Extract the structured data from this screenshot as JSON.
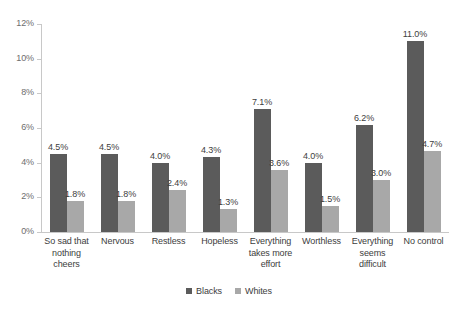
{
  "chart_data": {
    "type": "bar",
    "title": "",
    "subtitle": "",
    "xlabel": "",
    "ylabel": "",
    "ylim": [
      0,
      12
    ],
    "y_ticks": [
      "0%",
      "2%",
      "4%",
      "6%",
      "8%",
      "10%",
      "12%"
    ],
    "y_tick_values": [
      0,
      2,
      4,
      6,
      8,
      10,
      12
    ],
    "grid": false,
    "legend_position": "bottom",
    "categories": [
      "So sad that nothing cheers",
      "Nervous",
      "Restless",
      "Hopeless",
      "Everything takes more effort",
      "Worthless",
      "Everything seems difficult",
      "No control"
    ],
    "series": [
      {
        "name": "Blacks",
        "color": "#5b5b5b",
        "values": [
          4.5,
          4.5,
          4.0,
          4.3,
          7.1,
          4.0,
          6.2,
          11.0
        ],
        "labels": [
          "4.5%",
          "4.5%",
          "4.0%",
          "4.3%",
          "7.1%",
          "4.0%",
          "6.2%",
          "11.0%"
        ]
      },
      {
        "name": "Whites",
        "color": "#a8a8a8",
        "values": [
          1.8,
          1.8,
          2.4,
          1.3,
          3.6,
          1.5,
          3.0,
          4.7
        ],
        "labels": [
          "1.8%",
          "1.8%",
          "2.4%",
          "1.3%",
          "3.6%",
          "1.5%",
          "3.0%",
          "4.7%"
        ]
      }
    ]
  },
  "legend": {
    "items": [
      {
        "label": "Blacks",
        "color": "#5b5b5b"
      },
      {
        "label": "Whites",
        "color": "#a8a8a8"
      }
    ]
  }
}
